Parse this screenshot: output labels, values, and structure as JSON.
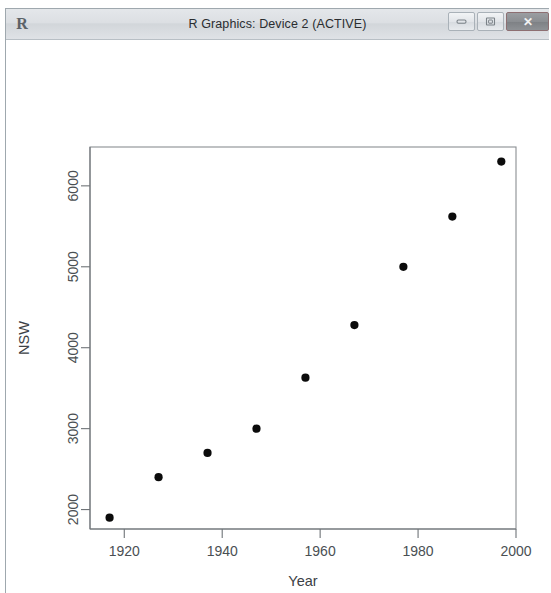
{
  "window": {
    "title": "R Graphics: Device 2 (ACTIVE)",
    "app_icon": "R",
    "controls": {
      "minimize_label": "Minimize",
      "maximize_label": "Maximize",
      "close_label": "✕"
    }
  },
  "chart_data": {
    "type": "scatter",
    "title": "",
    "xlabel": "Year",
    "ylabel": "NSW",
    "xlim": [
      1913,
      2000
    ],
    "ylim": [
      1760,
      6480
    ],
    "grid": false,
    "legend": null,
    "x_ticks": [
      1920,
      1940,
      1960,
      1980,
      2000
    ],
    "y_ticks": [
      2000,
      3000,
      4000,
      5000,
      6000
    ],
    "x_tick_labels": [
      "1920",
      "1940",
      "1960",
      "1980",
      "2000"
    ],
    "y_tick_labels": [
      "2000",
      "3000",
      "4000",
      "5000",
      "6000"
    ],
    "point_symbol": "filled-circle",
    "point_color": "#0b0b0b",
    "x": [
      1917,
      1927,
      1937,
      1947,
      1957,
      1967,
      1977,
      1987,
      1997
    ],
    "y": [
      1900,
      2400,
      2700,
      3000,
      3630,
      4280,
      5000,
      5620,
      6300
    ],
    "series": [
      {
        "name": "NSW",
        "points": [
          {
            "x": 1917,
            "y": 1900
          },
          {
            "x": 1927,
            "y": 2400
          },
          {
            "x": 1937,
            "y": 2700
          },
          {
            "x": 1947,
            "y": 3000
          },
          {
            "x": 1957,
            "y": 3630
          },
          {
            "x": 1967,
            "y": 4280
          },
          {
            "x": 1977,
            "y": 5000
          },
          {
            "x": 1987,
            "y": 5620
          },
          {
            "x": 1997,
            "y": 6300
          }
        ]
      }
    ]
  }
}
